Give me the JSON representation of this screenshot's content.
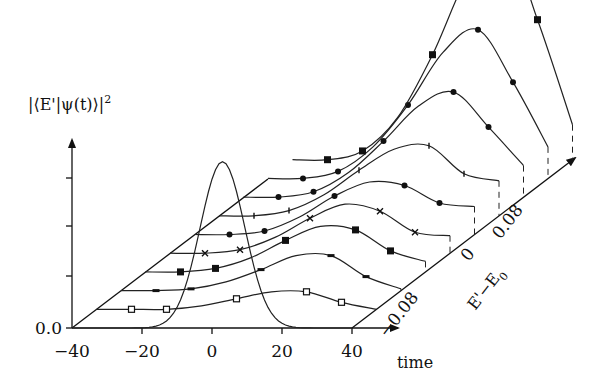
{
  "chart_data": {
    "type": "line",
    "subtype": "3d-waterfall",
    "title": "",
    "ylabel": "|⟨E'|ψ(t)⟩|²",
    "xlabel": "time",
    "zlabel": "E' − E₀",
    "x_ticks": [
      -40,
      -20,
      0,
      20,
      40
    ],
    "x_tick_labels": [
      "−40",
      "−20",
      "0",
      "20",
      "40"
    ],
    "xlim": [
      -40,
      40
    ],
    "y_tick_labels": [
      "0.0"
    ],
    "y_ticks_unlabeled": 3,
    "z_tick_labels": [
      "−0.08",
      "0",
      "0.08"
    ],
    "z_ticks": [
      -0.08,
      0,
      0.08
    ],
    "pulse": {
      "name": "excitation pulse",
      "center_time": 3,
      "width": 9,
      "peak": 0.95
    },
    "series": [
      {
        "name": "E'-E0 = -0.16",
        "marker": "open-square",
        "offset_index": 0,
        "x": [
          -40,
          -30,
          -20,
          -10,
          0,
          10,
          20,
          30,
          40
        ],
        "values": [
          0,
          0,
          0,
          0.02,
          0.06,
          0.1,
          0.1,
          0.04,
          0
        ]
      },
      {
        "name": "E'-E0 = -0.12",
        "marker": "bar",
        "offset_index": 1,
        "x": [
          -40,
          -30,
          -20,
          -10,
          0,
          10,
          20,
          30,
          40
        ],
        "values": [
          0,
          0,
          0.01,
          0.05,
          0.12,
          0.2,
          0.2,
          0.08,
          0.01
        ]
      },
      {
        "name": "E'-E0 = -0.08",
        "marker": "filled-square",
        "offset_index": 2,
        "x": [
          -40,
          -30,
          -20,
          -10,
          0,
          10,
          20,
          30,
          40
        ],
        "values": [
          0,
          0,
          0.02,
          0.08,
          0.18,
          0.26,
          0.24,
          0.12,
          0.06
        ]
      },
      {
        "name": "E'-E0 = -0.04",
        "marker": "cross",
        "offset_index": 3,
        "x": [
          -40,
          -30,
          -20,
          -10,
          0,
          10,
          20,
          30,
          40
        ],
        "values": [
          0,
          0,
          0.02,
          0.09,
          0.2,
          0.28,
          0.24,
          0.12,
          0.1
        ]
      },
      {
        "name": "E'-E0 = 0",
        "marker": "filled-circle",
        "offset_index": 4,
        "x": [
          -40,
          -30,
          -20,
          -10,
          0,
          10,
          20,
          30,
          40
        ],
        "values": [
          0,
          0,
          0.02,
          0.1,
          0.22,
          0.3,
          0.28,
          0.18,
          0.16
        ]
      },
      {
        "name": "E'-E0 = 0.04",
        "marker": "tick",
        "offset_index": 5,
        "x": [
          -40,
          -30,
          -20,
          -10,
          0,
          10,
          20,
          30,
          40
        ],
        "values": [
          0,
          0,
          0.03,
          0.12,
          0.26,
          0.38,
          0.4,
          0.24,
          0.2
        ]
      },
      {
        "name": "E'-E0 = 0.08",
        "marker": "filled-circle",
        "offset_index": 6,
        "x": [
          -40,
          -30,
          -20,
          -10,
          0,
          10,
          20,
          30,
          40
        ],
        "values": [
          0,
          0,
          0.03,
          0.14,
          0.32,
          0.52,
          0.6,
          0.4,
          0.18
        ]
      },
      {
        "name": "E'-E0 = 0.12",
        "marker": "filled-circle",
        "offset_index": 7,
        "x": [
          -40,
          -30,
          -20,
          -10,
          0,
          10,
          20,
          30,
          40
        ],
        "values": [
          0,
          0,
          0.04,
          0.18,
          0.42,
          0.72,
          0.85,
          0.55,
          0.18
        ]
      },
      {
        "name": "E'-E0 = 0.16",
        "marker": "filled-square",
        "offset_index": 8,
        "x": [
          -40,
          -30,
          -20,
          -10,
          0,
          10,
          20,
          30,
          40
        ],
        "values": [
          0,
          0,
          0.05,
          0.24,
          0.6,
          1.05,
          1.3,
          0.8,
          0.2
        ]
      }
    ],
    "grid": false,
    "legend": "none"
  },
  "labels": {
    "y_title": "|⟨E'|ψ(t)⟩|",
    "y_title_sup": "2",
    "y_zero": "0.0",
    "x_title": "time",
    "z_title_main": "E'−E",
    "z_title_sub": "0",
    "x_ticks": [
      "−40",
      "−20",
      "0",
      "20",
      "40"
    ],
    "z_ticks": [
      "−0.08",
      "0",
      "0.08"
    ]
  }
}
